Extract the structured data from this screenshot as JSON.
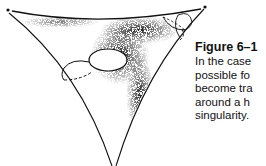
{
  "figure": {
    "colors": {
      "ink": "#111111",
      "background": "#ffffff"
    }
  },
  "caption": {
    "title": "Figure 6–1",
    "lines": [
      "In the case",
      "possible fo",
      "become tra",
      "around a h",
      "singularity."
    ]
  }
}
